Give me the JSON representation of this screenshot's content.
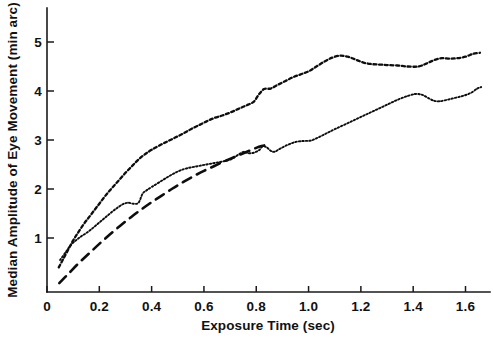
{
  "chart_data": {
    "type": "line",
    "title": "",
    "subtitle": "",
    "xlabel": "Exposure Time (sec)",
    "ylabel": "Median Amplitude of Eye Movement (min arc)",
    "xlim": [
      0,
      1.7
    ],
    "ylim": [
      0,
      5.8
    ],
    "xticks": [
      0,
      0.2,
      0.4,
      0.6,
      0.8,
      1.0,
      1.2,
      1.4,
      1.6
    ],
    "xticklabels": [
      "0",
      "0.2",
      "0.4",
      "0.6",
      "0.8",
      "1.0",
      "1.2",
      "1.4",
      "1.6"
    ],
    "yticks": [
      1,
      2,
      3,
      4,
      5
    ],
    "yticklabels": [
      "1",
      "2",
      "3",
      "4",
      "5"
    ],
    "grid": false,
    "legend": "none",
    "background_color": "#ffffff",
    "ink_color": "#0d0d0d",
    "series": [
      {
        "name": "upper-curve",
        "style": "dashed",
        "x": [
          0.045,
          0.06,
          0.08,
          0.1,
          0.12,
          0.14,
          0.16,
          0.18,
          0.2,
          0.22,
          0.24,
          0.26,
          0.28,
          0.3,
          0.32,
          0.34,
          0.36,
          0.38,
          0.4,
          0.43,
          0.46,
          0.49,
          0.52,
          0.55,
          0.58,
          0.61,
          0.64,
          0.67,
          0.7,
          0.73,
          0.76,
          0.79,
          0.81,
          0.83,
          0.855,
          0.88,
          0.91,
          0.94,
          0.97,
          1.0,
          1.03,
          1.06,
          1.09,
          1.12,
          1.15,
          1.18,
          1.21,
          1.24,
          1.27,
          1.3,
          1.34,
          1.38,
          1.42,
          1.45,
          1.48,
          1.51,
          1.54,
          1.57,
          1.6,
          1.63,
          1.655
        ],
        "y": [
          0.4,
          0.55,
          0.75,
          0.95,
          1.12,
          1.28,
          1.42,
          1.56,
          1.7,
          1.84,
          1.97,
          2.09,
          2.21,
          2.33,
          2.44,
          2.55,
          2.65,
          2.73,
          2.8,
          2.89,
          2.97,
          3.05,
          3.13,
          3.22,
          3.3,
          3.38,
          3.45,
          3.5,
          3.56,
          3.63,
          3.7,
          3.78,
          3.93,
          4.04,
          4.05,
          4.12,
          4.2,
          4.28,
          4.34,
          4.4,
          4.5,
          4.6,
          4.68,
          4.72,
          4.7,
          4.64,
          4.58,
          4.55,
          4.54,
          4.53,
          4.52,
          4.5,
          4.5,
          4.56,
          4.63,
          4.67,
          4.66,
          4.67,
          4.7,
          4.76,
          4.78
        ]
      },
      {
        "name": "middle-curve",
        "style": "dotted",
        "x": [
          0.05,
          0.07,
          0.09,
          0.11,
          0.13,
          0.15,
          0.17,
          0.19,
          0.21,
          0.23,
          0.25,
          0.27,
          0.29,
          0.31,
          0.33,
          0.35,
          0.365,
          0.38,
          0.4,
          0.43,
          0.46,
          0.49,
          0.52,
          0.55,
          0.58,
          0.61,
          0.64,
          0.67,
          0.7,
          0.72,
          0.74,
          0.755,
          0.77,
          0.79,
          0.81,
          0.825,
          0.84,
          0.855,
          0.87,
          0.89,
          0.92,
          0.95,
          0.98,
          1.01,
          1.04,
          1.07,
          1.1,
          1.14,
          1.18,
          1.22,
          1.26,
          1.3,
          1.34,
          1.38,
          1.41,
          1.435,
          1.46,
          1.48,
          1.5,
          1.53,
          1.56,
          1.59,
          1.62,
          1.645,
          1.66
        ],
        "y": [
          0.55,
          0.7,
          0.85,
          0.95,
          1.03,
          1.1,
          1.18,
          1.27,
          1.36,
          1.45,
          1.54,
          1.62,
          1.69,
          1.72,
          1.7,
          1.72,
          1.9,
          1.97,
          2.04,
          2.14,
          2.24,
          2.33,
          2.4,
          2.44,
          2.47,
          2.5,
          2.53,
          2.56,
          2.6,
          2.66,
          2.73,
          2.76,
          2.73,
          2.74,
          2.79,
          2.87,
          2.85,
          2.78,
          2.76,
          2.82,
          2.9,
          2.96,
          2.98,
          2.99,
          3.06,
          3.14,
          3.22,
          3.32,
          3.42,
          3.52,
          3.62,
          3.72,
          3.82,
          3.9,
          3.94,
          3.92,
          3.85,
          3.8,
          3.79,
          3.82,
          3.86,
          3.9,
          3.96,
          4.05,
          4.08
        ]
      },
      {
        "name": "fitted-curve",
        "style": "long-dash",
        "x": [
          0.047,
          0.08,
          0.12,
          0.16,
          0.2,
          0.24,
          0.28,
          0.32,
          0.36,
          0.4,
          0.44,
          0.48,
          0.52,
          0.56,
          0.6,
          0.64,
          0.68,
          0.72,
          0.76,
          0.8,
          0.83
        ],
        "y": [
          0.08,
          0.26,
          0.48,
          0.68,
          0.88,
          1.07,
          1.25,
          1.42,
          1.58,
          1.73,
          1.87,
          2.01,
          2.14,
          2.26,
          2.37,
          2.47,
          2.57,
          2.66,
          2.75,
          2.84,
          2.89
        ]
      }
    ]
  }
}
